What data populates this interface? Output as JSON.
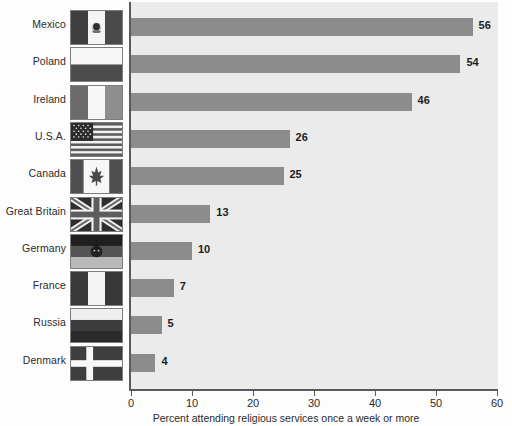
{
  "chart_data": {
    "type": "bar",
    "orientation": "horizontal",
    "title": "",
    "xlabel": "Percent attending religious services once a week or more",
    "ylabel": "",
    "xlim": [
      0,
      60
    ],
    "xticks": [
      0,
      10,
      20,
      30,
      40,
      50,
      60
    ],
    "grid": false,
    "legend": null,
    "categories": [
      "Mexico",
      "Poland",
      "Ireland",
      "U.S.A.",
      "Canada",
      "Great Britain",
      "Germany",
      "France",
      "Russia",
      "Denmark"
    ],
    "values": [
      56,
      54,
      46,
      26,
      25,
      13,
      10,
      7,
      5,
      4
    ],
    "value_labels": [
      "56",
      "54",
      "46",
      "26",
      "25",
      "13",
      "10",
      "7",
      "5",
      "4"
    ],
    "bar_color": "#8c8c8c",
    "plot_background": "#ebebeb",
    "axis_color": "#5a5a5a",
    "rows": [
      {
        "label": "Mexico",
        "value": 56,
        "value_label": "56",
        "flag": "flag-mexico"
      },
      {
        "label": "Poland",
        "value": 54,
        "value_label": "54",
        "flag": "flag-poland"
      },
      {
        "label": "Ireland",
        "value": 46,
        "value_label": "46",
        "flag": "flag-ireland"
      },
      {
        "label": "U.S.A.",
        "value": 26,
        "value_label": "26",
        "flag": "flag-usa"
      },
      {
        "label": "Canada",
        "value": 25,
        "value_label": "25",
        "flag": "flag-canada"
      },
      {
        "label": "Great Britain",
        "value": 13,
        "value_label": "13",
        "flag": "flag-great-britain"
      },
      {
        "label": "Germany",
        "value": 10,
        "value_label": "10",
        "flag": "flag-germany"
      },
      {
        "label": "France",
        "value": 7,
        "value_label": "7",
        "flag": "flag-france"
      },
      {
        "label": "Russia",
        "value": 5,
        "value_label": "5",
        "flag": "flag-russia"
      },
      {
        "label": "Denmark",
        "value": 4,
        "value_label": "4",
        "flag": "flag-denmark"
      }
    ],
    "xtick_labels": [
      "0",
      "10",
      "20",
      "30",
      "40",
      "50",
      "60"
    ]
  }
}
